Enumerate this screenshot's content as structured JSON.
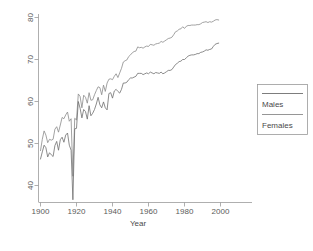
{
  "chart_data": {
    "type": "line",
    "title": "",
    "xlabel": "Year",
    "ylabel": "",
    "xlim": [
      1900,
      2000
    ],
    "ylim": [
      36,
      81
    ],
    "xticks": [
      1900,
      1920,
      1940,
      1960,
      1980,
      2000
    ],
    "yticks": [
      40,
      50,
      60,
      70,
      80
    ],
    "grid": false,
    "legend_position": "right",
    "legend_entries": [
      "Males",
      "Females"
    ],
    "colors": {
      "males": "#6e6e6e",
      "females": "#8a8a8a",
      "axis": "#9a9a9a",
      "text": "#4a4a4a",
      "background": "#ffffff"
    },
    "x": [
      1900,
      1901,
      1902,
      1903,
      1904,
      1905,
      1906,
      1907,
      1908,
      1909,
      1910,
      1911,
      1912,
      1913,
      1914,
      1915,
      1916,
      1917,
      1918,
      1919,
      1920,
      1921,
      1922,
      1923,
      1924,
      1925,
      1926,
      1927,
      1928,
      1929,
      1930,
      1931,
      1932,
      1933,
      1934,
      1935,
      1936,
      1937,
      1938,
      1939,
      1940,
      1941,
      1942,
      1943,
      1944,
      1945,
      1946,
      1947,
      1948,
      1949,
      1950,
      1951,
      1952,
      1953,
      1954,
      1955,
      1956,
      1957,
      1958,
      1959,
      1960,
      1961,
      1962,
      1963,
      1964,
      1965,
      1966,
      1967,
      1968,
      1969,
      1970,
      1971,
      1972,
      1973,
      1974,
      1975,
      1976,
      1977,
      1978,
      1979,
      1980,
      1981,
      1982,
      1983,
      1984,
      1985,
      1986,
      1987,
      1988,
      1989,
      1990,
      1991,
      1992,
      1993,
      1994,
      1995,
      1996,
      1997,
      1998,
      1999
    ],
    "series": [
      {
        "name": "Females",
        "values": [
          48.3,
          51.0,
          53.0,
          52.0,
          50.2,
          51.0,
          50.8,
          51.0,
          53.4,
          54.0,
          52.7,
          54.4,
          56.2,
          55.9,
          56.8,
          57.5,
          55.3,
          55.9,
          42.2,
          56.0,
          55.6,
          61.8,
          61.2,
          58.5,
          61.5,
          61.0,
          59.6,
          62.1,
          60.3,
          60.4,
          61.6,
          62.6,
          63.5,
          63.3,
          61.6,
          63.9,
          62.4,
          64.4,
          65.3,
          65.4,
          65.2,
          66.0,
          66.6,
          65.7,
          66.8,
          67.9,
          69.4,
          69.7,
          69.9,
          70.7,
          71.1,
          71.6,
          71.9,
          72.0,
          73.0,
          72.8,
          72.9,
          72.7,
          73.0,
          73.2,
          73.1,
          73.6,
          73.5,
          73.4,
          73.7,
          73.8,
          73.9,
          74.3,
          74.1,
          74.4,
          74.7,
          75.0,
          75.1,
          75.3,
          75.9,
          76.6,
          76.8,
          77.2,
          77.3,
          77.8,
          77.4,
          77.9,
          78.1,
          78.1,
          78.2,
          78.2,
          78.2,
          78.3,
          78.3,
          78.5,
          78.8,
          78.9,
          79.0,
          78.8,
          79.0,
          78.9,
          79.1,
          79.4,
          79.5,
          79.4
        ]
      },
      {
        "name": "Males",
        "values": [
          46.3,
          48.0,
          49.6,
          49.0,
          46.8,
          47.8,
          47.3,
          46.9,
          49.5,
          50.5,
          48.4,
          50.9,
          51.5,
          50.3,
          52.0,
          52.5,
          49.6,
          48.4,
          36.6,
          53.5,
          53.6,
          60.0,
          58.4,
          56.1,
          58.1,
          57.6,
          55.8,
          59.0,
          56.6,
          57.2,
          58.1,
          59.4,
          61.0,
          59.2,
          58.5,
          59.9,
          58.5,
          58.0,
          61.9,
          62.1,
          60.8,
          62.5,
          62.9,
          62.4,
          62.0,
          62.9,
          64.4,
          64.4,
          64.6,
          65.2,
          65.6,
          65.6,
          65.8,
          66.0,
          66.7,
          66.7,
          66.7,
          66.4,
          66.6,
          66.8,
          66.6,
          67.0,
          66.8,
          66.6,
          66.9,
          66.8,
          66.7,
          67.0,
          66.6,
          66.8,
          67.1,
          67.4,
          67.4,
          67.6,
          68.2,
          68.8,
          69.1,
          69.5,
          69.6,
          70.0,
          70.0,
          70.4,
          70.8,
          71.0,
          71.1,
          71.1,
          71.2,
          71.4,
          71.4,
          71.7,
          71.8,
          72.0,
          72.3,
          72.2,
          72.4,
          72.5,
          73.1,
          73.6,
          73.8,
          73.9
        ]
      }
    ]
  },
  "axis": {
    "xlabel": "Year",
    "xtick_labels": [
      "1900",
      "1920",
      "1940",
      "1960",
      "1980",
      "2000"
    ],
    "ytick_labels": [
      "40",
      "50",
      "60",
      "70",
      "80"
    ]
  },
  "legend": {
    "entries": [
      {
        "label": "Males"
      },
      {
        "label": "Females"
      }
    ]
  }
}
